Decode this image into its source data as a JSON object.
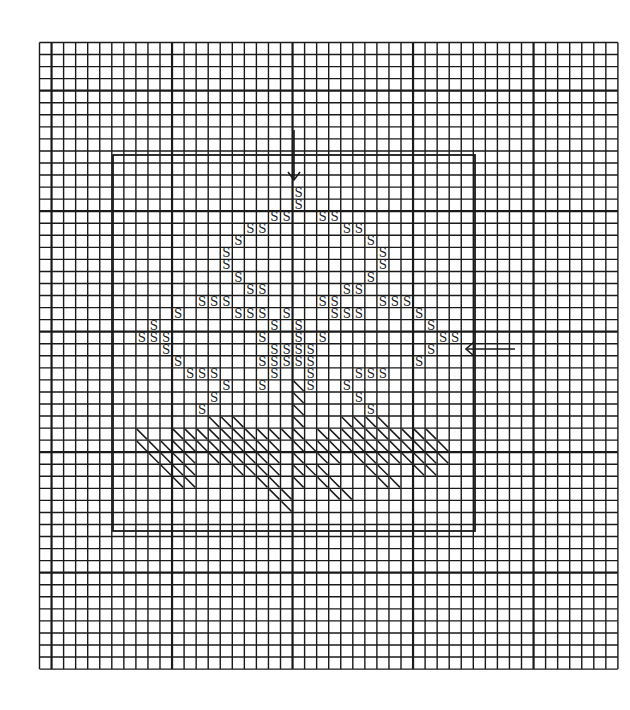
{
  "title": "Cross-stitch chart: leaf and stems motif",
  "canvas": {
    "width": 630,
    "height": 710,
    "background": "#ffffff",
    "ink": "#1a1a1a"
  },
  "grid": {
    "origin_x": 39.5,
    "origin_y": 42.5,
    "cell": 12.05,
    "cols": 48,
    "rows": 52,
    "major_every": 10,
    "major_col_offset": 1,
    "major_row_offset": 4,
    "minor_width": 1.4,
    "major_width": 2.2
  },
  "frame": {
    "x": 113,
    "y": 155,
    "w": 362,
    "h": 376,
    "stroke_width": 1.8
  },
  "markers": [
    {
      "name": "top-center-arrow",
      "direction": "down",
      "x": 294,
      "y1": 130,
      "y2": 180
    },
    {
      "name": "right-center-arrow",
      "direction": "left",
      "y": 349,
      "x1": 466,
      "x2": 515
    }
  ],
  "symbol": "S",
  "legend": {
    "S": "stitch symbol",
    "diagonal": "half-stitch / backstitch"
  },
  "chart_data": {
    "type": "heatmap",
    "title": "",
    "s_cells": [
      [
        21,
        12
      ],
      [
        21,
        13
      ],
      [
        19,
        14
      ],
      [
        20,
        14
      ],
      [
        23,
        14
      ],
      [
        24,
        14
      ],
      [
        17,
        15
      ],
      [
        18,
        15
      ],
      [
        25,
        15
      ],
      [
        26,
        15
      ],
      [
        16,
        16
      ],
      [
        27,
        16
      ],
      [
        15,
        17
      ],
      [
        28,
        17
      ],
      [
        15,
        18
      ],
      [
        28,
        18
      ],
      [
        16,
        19
      ],
      [
        27,
        19
      ],
      [
        17,
        20
      ],
      [
        18,
        20
      ],
      [
        25,
        20
      ],
      [
        26,
        20
      ],
      [
        13,
        21
      ],
      [
        14,
        21
      ],
      [
        15,
        21
      ],
      [
        23,
        21
      ],
      [
        24,
        21
      ],
      [
        28,
        21
      ],
      [
        29,
        21
      ],
      [
        30,
        21
      ],
      [
        11,
        22
      ],
      [
        16,
        22
      ],
      [
        17,
        22
      ],
      [
        18,
        22
      ],
      [
        20,
        22
      ],
      [
        24,
        22
      ],
      [
        25,
        22
      ],
      [
        26,
        22
      ],
      [
        31,
        22
      ],
      [
        9,
        23
      ],
      [
        19,
        23
      ],
      [
        21,
        23
      ],
      [
        32,
        23
      ],
      [
        8,
        24
      ],
      [
        9,
        24
      ],
      [
        10,
        24
      ],
      [
        18,
        24
      ],
      [
        21,
        24
      ],
      [
        23,
        24
      ],
      [
        33,
        24
      ],
      [
        34,
        24
      ],
      [
        10,
        25
      ],
      [
        19,
        25
      ],
      [
        20,
        25
      ],
      [
        21,
        25
      ],
      [
        22,
        25
      ],
      [
        32,
        25
      ],
      [
        11,
        26
      ],
      [
        18,
        26
      ],
      [
        19,
        26
      ],
      [
        20,
        26
      ],
      [
        21,
        26
      ],
      [
        22,
        26
      ],
      [
        31,
        26
      ],
      [
        12,
        27
      ],
      [
        13,
        27
      ],
      [
        14,
        27
      ],
      [
        19,
        27
      ],
      [
        22,
        27
      ],
      [
        26,
        27
      ],
      [
        27,
        27
      ],
      [
        28,
        27
      ],
      [
        15,
        28
      ],
      [
        18,
        28
      ],
      [
        22,
        28
      ],
      [
        25,
        28
      ],
      [
        14,
        29
      ],
      [
        26,
        29
      ],
      [
        13,
        30
      ],
      [
        27,
        30
      ]
    ],
    "diagonal_cells": [
      [
        21,
        28
      ],
      [
        21,
        29
      ],
      [
        21,
        30
      ],
      [
        21,
        31
      ],
      [
        21,
        32
      ],
      [
        21,
        33
      ],
      [
        21,
        34
      ],
      [
        21,
        35
      ],
      [
        21,
        36
      ],
      [
        14,
        31
      ],
      [
        15,
        31
      ],
      [
        16,
        31
      ],
      [
        25,
        31
      ],
      [
        26,
        31
      ],
      [
        27,
        31
      ],
      [
        28,
        31
      ],
      [
        8,
        32
      ],
      [
        11,
        32
      ],
      [
        12,
        32
      ],
      [
        13,
        32
      ],
      [
        14,
        32
      ],
      [
        15,
        32
      ],
      [
        16,
        32
      ],
      [
        17,
        32
      ],
      [
        18,
        32
      ],
      [
        19,
        32
      ],
      [
        20,
        32
      ],
      [
        23,
        32
      ],
      [
        24,
        32
      ],
      [
        25,
        32
      ],
      [
        26,
        32
      ],
      [
        27,
        32
      ],
      [
        28,
        32
      ],
      [
        29,
        32
      ],
      [
        30,
        32
      ],
      [
        31,
        32
      ],
      [
        32,
        32
      ],
      [
        8,
        33
      ],
      [
        9,
        33
      ],
      [
        10,
        33
      ],
      [
        11,
        33
      ],
      [
        12,
        33
      ],
      [
        13,
        33
      ],
      [
        14,
        33
      ],
      [
        15,
        33
      ],
      [
        16,
        33
      ],
      [
        17,
        33
      ],
      [
        18,
        33
      ],
      [
        19,
        33
      ],
      [
        22,
        33
      ],
      [
        23,
        33
      ],
      [
        24,
        33
      ],
      [
        25,
        33
      ],
      [
        26,
        33
      ],
      [
        27,
        33
      ],
      [
        28,
        33
      ],
      [
        29,
        33
      ],
      [
        30,
        33
      ],
      [
        31,
        33
      ],
      [
        32,
        33
      ],
      [
        33,
        33
      ],
      [
        9,
        34
      ],
      [
        10,
        34
      ],
      [
        11,
        34
      ],
      [
        12,
        34
      ],
      [
        14,
        34
      ],
      [
        15,
        34
      ],
      [
        16,
        34
      ],
      [
        17,
        34
      ],
      [
        18,
        34
      ],
      [
        19,
        34
      ],
      [
        23,
        34
      ],
      [
        24,
        34
      ],
      [
        26,
        34
      ],
      [
        27,
        34
      ],
      [
        28,
        34
      ],
      [
        29,
        34
      ],
      [
        30,
        34
      ],
      [
        31,
        34
      ],
      [
        32,
        34
      ],
      [
        33,
        34
      ],
      [
        10,
        35
      ],
      [
        11,
        35
      ],
      [
        12,
        35
      ],
      [
        16,
        35
      ],
      [
        17,
        35
      ],
      [
        18,
        35
      ],
      [
        19,
        35
      ],
      [
        22,
        35
      ],
      [
        23,
        35
      ],
      [
        27,
        35
      ],
      [
        28,
        35
      ],
      [
        31,
        35
      ],
      [
        32,
        35
      ],
      [
        11,
        36
      ],
      [
        12,
        36
      ],
      [
        18,
        36
      ],
      [
        19,
        36
      ],
      [
        23,
        36
      ],
      [
        24,
        36
      ],
      [
        28,
        36
      ],
      [
        29,
        36
      ],
      [
        19,
        37
      ],
      [
        20,
        37
      ],
      [
        24,
        37
      ],
      [
        25,
        37
      ],
      [
        20,
        38
      ]
    ]
  }
}
